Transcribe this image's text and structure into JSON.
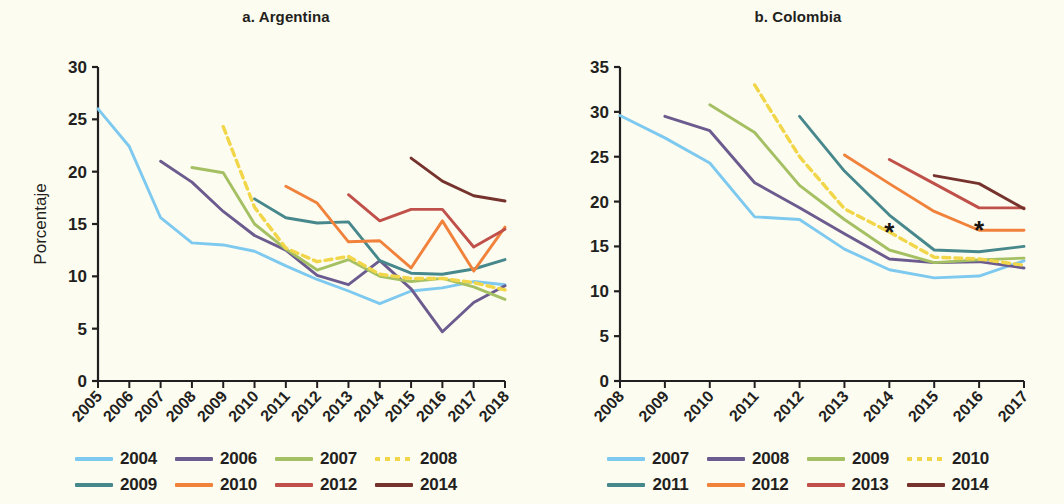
{
  "figure": {
    "background": "#fdfcf0",
    "ylabel": "Porcentaje"
  },
  "panels": [
    {
      "id": "a",
      "title": "a. Argentina",
      "ylabel": "Porcentaje",
      "legend_rows": [
        [
          {
            "label": "2004",
            "color": "#7ec9ef",
            "dashed": false
          },
          {
            "label": "2006",
            "color": "#6b5b8e",
            "dashed": false
          },
          {
            "label": "2007",
            "color": "#a4c063",
            "dashed": false
          },
          {
            "label": "2008",
            "color": "#f2d649",
            "dashed": true
          }
        ],
        [
          {
            "label": "2009",
            "color": "#47888c",
            "dashed": false
          },
          {
            "label": "2010",
            "color": "#f0823c",
            "dashed": false
          },
          {
            "label": "2012",
            "color": "#c0504a",
            "dashed": false
          },
          {
            "label": "2014",
            "color": "#76332e",
            "dashed": false
          }
        ]
      ]
    },
    {
      "id": "b",
      "title": "b. Colombia",
      "legend_rows": [
        [
          {
            "label": "2007",
            "color": "#7ec9ef",
            "dashed": false
          },
          {
            "label": "2008",
            "color": "#6b5b8e",
            "dashed": false
          },
          {
            "label": "2009",
            "color": "#a4c063",
            "dashed": false
          },
          {
            "label": "2010",
            "color": "#f2d649",
            "dashed": true
          }
        ],
        [
          {
            "label": "2011",
            "color": "#47888c",
            "dashed": false
          },
          {
            "label": "2012",
            "color": "#f0823c",
            "dashed": false
          },
          {
            "label": "2013",
            "color": "#c0504a",
            "dashed": false
          },
          {
            "label": "2014",
            "color": "#76332e",
            "dashed": false
          }
        ]
      ]
    }
  ],
  "chart_data": [
    {
      "type": "line",
      "title": "a. Argentina",
      "xlabel": "",
      "ylabel": "Porcentaje",
      "x": [
        "2005",
        "2006",
        "2007",
        "2008",
        "2009",
        "2010",
        "2011",
        "2012",
        "2013",
        "2014",
        "2015",
        "2016",
        "2017",
        "2018"
      ],
      "xlim": [
        "2005",
        "2018"
      ],
      "ylim": [
        0,
        30
      ],
      "yticks": [
        0,
        5,
        10,
        15,
        20,
        25,
        30
      ],
      "grid": false,
      "legend_position": "bottom",
      "series": [
        {
          "name": "2004",
          "color": "#7ec9ef",
          "dashed": false,
          "x": [
            "2005",
            "2006",
            "2007",
            "2008",
            "2009",
            "2010",
            "2011",
            "2012",
            "2013",
            "2014",
            "2015",
            "2016",
            "2017",
            "2018"
          ],
          "values": [
            26.0,
            22.4,
            15.6,
            13.2,
            13.0,
            12.4,
            11.0,
            9.7,
            8.6,
            7.4,
            8.6,
            8.9,
            9.5,
            9.2
          ]
        },
        {
          "name": "2006",
          "color": "#6b5b8e",
          "dashed": false,
          "x": [
            "2007",
            "2008",
            "2009",
            "2010",
            "2011",
            "2012",
            "2013",
            "2014",
            "2015",
            "2016",
            "2017",
            "2018"
          ],
          "values": [
            21.0,
            19.0,
            16.2,
            13.9,
            12.5,
            10.1,
            9.2,
            11.5,
            8.8,
            4.7,
            7.5,
            9.1
          ]
        },
        {
          "name": "2007",
          "color": "#a4c063",
          "dashed": false,
          "x": [
            "2008",
            "2009",
            "2010",
            "2011",
            "2012",
            "2013",
            "2014",
            "2015",
            "2016",
            "2017",
            "2018"
          ],
          "values": [
            20.4,
            19.9,
            15.0,
            12.6,
            10.6,
            11.6,
            10.0,
            9.5,
            9.8,
            9.0,
            7.8
          ]
        },
        {
          "name": "2008",
          "color": "#f2d649",
          "dashed": true,
          "x": [
            "2009",
            "2010",
            "2011",
            "2012",
            "2013",
            "2014",
            "2015",
            "2016",
            "2017",
            "2018"
          ],
          "values": [
            24.3,
            16.6,
            12.7,
            11.4,
            11.9,
            10.2,
            9.8,
            9.8,
            9.4,
            8.7
          ]
        },
        {
          "name": "2009",
          "color": "#47888c",
          "dashed": false,
          "x": [
            "2010",
            "2011",
            "2012",
            "2013",
            "2014",
            "2015",
            "2016",
            "2017",
            "2018"
          ],
          "values": [
            17.4,
            15.6,
            15.1,
            15.2,
            11.5,
            10.3,
            10.2,
            10.7,
            11.6
          ]
        },
        {
          "name": "2010",
          "color": "#f0823c",
          "dashed": false,
          "x": [
            "2011",
            "2012",
            "2013",
            "2014",
            "2015",
            "2016",
            "2017",
            "2018"
          ],
          "values": [
            18.6,
            17.0,
            13.3,
            13.4,
            10.8,
            15.3,
            10.5,
            14.7
          ]
        },
        {
          "name": "2012",
          "color": "#c0504a",
          "dashed": false,
          "x": [
            "2013",
            "2014",
            "2015",
            "2016",
            "2017",
            "2018"
          ],
          "values": [
            17.8,
            15.3,
            16.4,
            16.4,
            12.8,
            14.5
          ]
        },
        {
          "name": "2014",
          "color": "#76332e",
          "dashed": false,
          "x": [
            "2015",
            "2016",
            "2017",
            "2018"
          ],
          "values": [
            21.3,
            19.1,
            17.7,
            17.2
          ]
        }
      ]
    },
    {
      "type": "line",
      "title": "b. Colombia",
      "xlabel": "",
      "ylabel": "",
      "x": [
        "2008",
        "2009",
        "2010",
        "2011",
        "2012",
        "2013",
        "2014",
        "2015",
        "2016",
        "2017"
      ],
      "xlim": [
        "2008",
        "2017"
      ],
      "ylim": [
        0,
        35
      ],
      "yticks": [
        0,
        5,
        10,
        15,
        20,
        25,
        30,
        35
      ],
      "grid": false,
      "legend_position": "bottom",
      "annotations": [
        {
          "label": "*",
          "x": "2014",
          "y": 16.6,
          "series": "2010"
        },
        {
          "label": "*",
          "x": "2016",
          "y": 16.8,
          "series": "2012"
        }
      ],
      "series": [
        {
          "name": "2007",
          "color": "#7ec9ef",
          "dashed": false,
          "x": [
            "2008",
            "2009",
            "2010",
            "2011",
            "2012",
            "2013",
            "2014",
            "2015",
            "2016",
            "2017"
          ],
          "values": [
            29.6,
            27.1,
            24.3,
            18.3,
            18.0,
            14.7,
            12.4,
            11.5,
            11.7,
            13.4
          ]
        },
        {
          "name": "2008",
          "color": "#6b5b8e",
          "dashed": false,
          "x": [
            "2009",
            "2010",
            "2011",
            "2012",
            "2013",
            "2014",
            "2015",
            "2016",
            "2017"
          ],
          "values": [
            29.5,
            27.9,
            22.1,
            19.3,
            16.4,
            13.6,
            13.2,
            13.3,
            12.6
          ]
        },
        {
          "name": "2009",
          "color": "#a4c063",
          "dashed": false,
          "x": [
            "2010",
            "2011",
            "2012",
            "2013",
            "2014",
            "2015",
            "2016",
            "2017"
          ],
          "values": [
            30.8,
            27.7,
            21.8,
            18.0,
            14.6,
            13.2,
            13.5,
            13.7
          ]
        },
        {
          "name": "2010",
          "color": "#f2d649",
          "dashed": true,
          "x": [
            "2011",
            "2012",
            "2013",
            "2014",
            "2015",
            "2016",
            "2017"
          ],
          "values": [
            33.0,
            25.0,
            19.2,
            16.6,
            13.8,
            13.6,
            12.9
          ]
        },
        {
          "name": "2011",
          "color": "#47888c",
          "dashed": false,
          "x": [
            "2012",
            "2013",
            "2014",
            "2015",
            "2016",
            "2017"
          ],
          "values": [
            29.5,
            23.4,
            18.5,
            14.6,
            14.4,
            15.0
          ]
        },
        {
          "name": "2012",
          "color": "#f0823c",
          "dashed": false,
          "x": [
            "2013",
            "2014",
            "2015",
            "2016",
            "2017"
          ],
          "values": [
            25.2,
            22.0,
            18.9,
            16.8,
            16.8
          ]
        },
        {
          "name": "2013",
          "color": "#c0504a",
          "dashed": false,
          "x": [
            "2014",
            "2015",
            "2016",
            "2017"
          ],
          "values": [
            24.7,
            22.0,
            19.3,
            19.3
          ]
        },
        {
          "name": "2014",
          "color": "#76332e",
          "dashed": false,
          "x": [
            "2015",
            "2016",
            "2017"
          ],
          "values": [
            22.9,
            22.0,
            19.2
          ]
        }
      ]
    }
  ]
}
